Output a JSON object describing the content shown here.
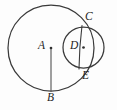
{
  "figure": {
    "background_color": "#fdfdfd",
    "stroke_color": "#3a3a3a",
    "label_color": "#242424",
    "width": 117,
    "height": 110
  },
  "labels": {
    "a": "A",
    "b": "B",
    "c": "C",
    "d": "D",
    "e": "E"
  },
  "chart_data": {
    "type": "diagram",
    "subtype": "euclidean-geometry",
    "units": "pixels",
    "coordinate_system": "image pixels, origin top-left, y increases downward",
    "circles": [
      {
        "name": "large-circle",
        "center_label": "A",
        "cx": 51,
        "cy": 48,
        "r": 43,
        "bbox": [
          8,
          5,
          94,
          91
        ]
      },
      {
        "name": "small-circle",
        "center_label": "D",
        "cx": 83.5,
        "cy": 47.5,
        "r": 20.5,
        "bbox": [
          63,
          27,
          104,
          68
        ]
      }
    ],
    "points": [
      {
        "label": "A",
        "x": 51,
        "y": 48,
        "role": "center-of-large-circle",
        "marker": "dot"
      },
      {
        "label": "B",
        "x": 51,
        "y": 91,
        "role": "bottom-of-large-circle",
        "marker": "none"
      },
      {
        "label": "C",
        "x": 82,
        "y": 25.5,
        "role": "upper-intersection-of-circles",
        "marker": "none"
      },
      {
        "label": "D",
        "x": 83.5,
        "y": 47.5,
        "role": "center-of-small-circle",
        "marker": "dot"
      },
      {
        "label": "E",
        "x": 79,
        "y": 69,
        "role": "lower-intersection-of-circles",
        "marker": "none"
      }
    ],
    "segments": [
      {
        "name": "radius-AB",
        "from": "A",
        "to": "B",
        "x1": 51,
        "y1": 48,
        "x2": 51,
        "y2": 91
      },
      {
        "name": "chord-CE",
        "from": "C",
        "to": "E",
        "x1": 82,
        "y1": 25.5,
        "x2": 79,
        "y2": 69
      }
    ],
    "label_positions": [
      {
        "label": "A",
        "x": 38,
        "y": 40
      },
      {
        "label": "B",
        "x": 47,
        "y": 92
      },
      {
        "label": "C",
        "x": 85,
        "y": 11
      },
      {
        "label": "D",
        "x": 70,
        "y": 40
      },
      {
        "label": "E",
        "x": 82,
        "y": 70
      }
    ],
    "grid": false,
    "legend": null,
    "axes": null
  }
}
